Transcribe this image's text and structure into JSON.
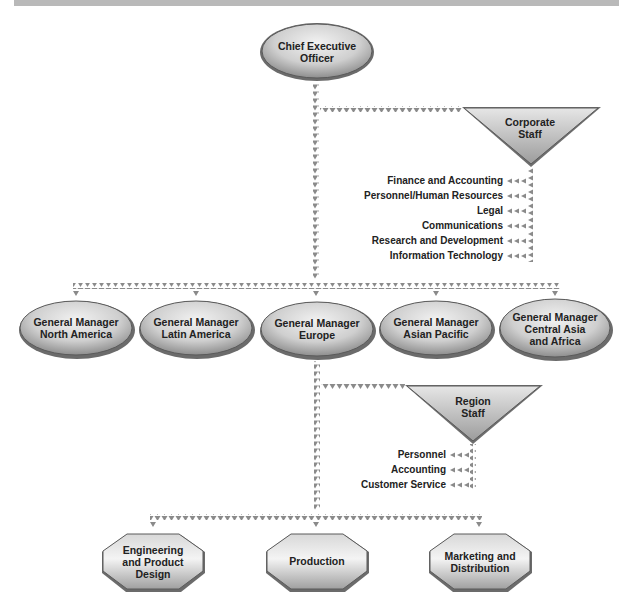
{
  "colors": {
    "node_fill_light": "#ececec",
    "node_fill_dark": "#9a9a9a",
    "node_stroke": "#5a5a5a",
    "connector": "#8a8a8a",
    "top_band": "#b9b9b9",
    "text": "#222222"
  },
  "ceo": {
    "label_line1": "Chief Executive",
    "label_line2": "Officer"
  },
  "corporate_staff": {
    "label_line1": "Corporate",
    "label_line2": "Staff",
    "functions": [
      "Finance and Accounting",
      "Personnel/Human Resources",
      "Legal",
      "Communications",
      "Research and Development",
      "Information Technology"
    ]
  },
  "general_managers": [
    {
      "line1": "General Manager",
      "line2": "North America",
      "line3": ""
    },
    {
      "line1": "General Manager",
      "line2": "Latin America",
      "line3": ""
    },
    {
      "line1": "General Manager",
      "line2": "Europe",
      "line3": ""
    },
    {
      "line1": "General Manager",
      "line2": "Asian Pacific",
      "line3": ""
    },
    {
      "line1": "General Manager",
      "line2": "Central Asia",
      "line3": "and Africa"
    }
  ],
  "region_staff": {
    "label_line1": "Region",
    "label_line2": "Staff",
    "functions": [
      "Personnel",
      "Accounting",
      "Customer Service"
    ]
  },
  "departments": [
    {
      "line1": "Engineering",
      "line2": "and Product",
      "line3": "Design"
    },
    {
      "line1": "Production",
      "line2": "",
      "line3": ""
    },
    {
      "line1": "Marketing and",
      "line2": "Distribution",
      "line3": ""
    }
  ]
}
